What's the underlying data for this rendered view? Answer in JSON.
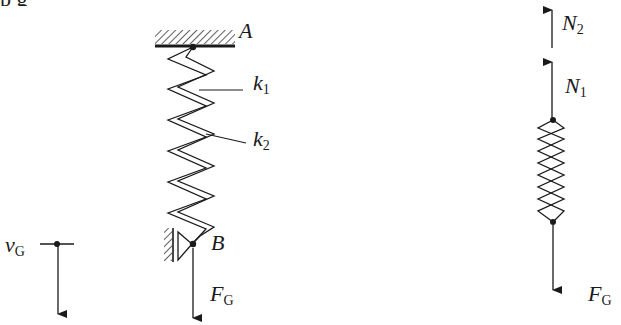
{
  "diagram": {
    "type": "mechanics-free-body-diagram",
    "colors": {
      "ink": "#1a1a1a",
      "background": "#ffffff"
    }
  },
  "header_fragment": {
    "text": "  p    g"
  },
  "left_system": {
    "support_label": "A",
    "spring_labels": {
      "k1_main": "k",
      "k1_sub": "1",
      "k2_main": "k",
      "k2_sub": "2"
    },
    "end_label": "B",
    "force_label": {
      "main": "F",
      "sub": "G"
    },
    "velocity_label": {
      "main": "v",
      "sub": "G"
    }
  },
  "free_body": {
    "forces": [
      {
        "main": "N",
        "sub": "2",
        "direction": "up"
      },
      {
        "main": "N",
        "sub": "1",
        "direction": "up"
      },
      {
        "main": "F",
        "sub": "G",
        "direction": "down"
      }
    ]
  }
}
